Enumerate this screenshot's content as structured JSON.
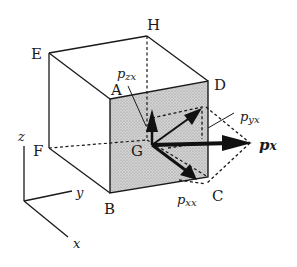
{
  "figure": {
    "vertices": {
      "E": "E",
      "H": "H",
      "D": "D",
      "A": "A",
      "F": "F",
      "B": "B",
      "C": "C",
      "G": "G"
    },
    "vectors": {
      "pzx": {
        "main": "p",
        "sub": "zx"
      },
      "pyx": {
        "main": "p",
        "sub": "yx"
      },
      "pxx": {
        "main": "p",
        "sub": "xx"
      },
      "px": {
        "main": "p",
        "sub": "x"
      }
    },
    "axes": {
      "x": "x",
      "y": "y",
      "z": "z"
    },
    "colors": {
      "line": "#1a1a1a",
      "face_fill": "#c8c8c8",
      "background": "#ffffff"
    }
  }
}
